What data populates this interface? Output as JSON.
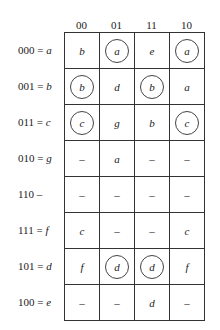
{
  "columns": [
    "00",
    "01",
    "11",
    "10"
  ],
  "rows": [
    {
      "code": "000",
      "eq": " = ",
      "state": "a",
      "cells": [
        {
          "v": "b",
          "circled": false
        },
        {
          "v": "a",
          "circled": true
        },
        {
          "v": "e",
          "circled": false
        },
        {
          "v": "a",
          "circled": true
        }
      ]
    },
    {
      "code": "001",
      "eq": " = ",
      "state": "b",
      "cells": [
        {
          "v": "b",
          "circled": true
        },
        {
          "v": "d",
          "circled": false
        },
        {
          "v": "b",
          "circled": true
        },
        {
          "v": "a",
          "circled": false
        }
      ]
    },
    {
      "code": "011",
      "eq": " = ",
      "state": "c",
      "cells": [
        {
          "v": "c",
          "circled": true
        },
        {
          "v": "g",
          "circled": false
        },
        {
          "v": "b",
          "circled": false
        },
        {
          "v": "c",
          "circled": true
        }
      ]
    },
    {
      "code": "010",
      "eq": " = ",
      "state": "g",
      "cells": [
        {
          "v": "–",
          "circled": false
        },
        {
          "v": "a",
          "circled": false
        },
        {
          "v": "–",
          "circled": false
        },
        {
          "v": "–",
          "circled": false
        }
      ]
    },
    {
      "code": "110",
      "eq": " –",
      "state": "",
      "cells": [
        {
          "v": "–",
          "circled": false
        },
        {
          "v": "–",
          "circled": false
        },
        {
          "v": "–",
          "circled": false
        },
        {
          "v": "–",
          "circled": false
        }
      ]
    },
    {
      "code": "111",
      "eq": " = ",
      "state": "f",
      "cells": [
        {
          "v": "c",
          "circled": false
        },
        {
          "v": "–",
          "circled": false
        },
        {
          "v": "–",
          "circled": false
        },
        {
          "v": "c",
          "circled": false
        }
      ]
    },
    {
      "code": "101",
      "eq": " = ",
      "state": "d",
      "cells": [
        {
          "v": "f",
          "circled": false
        },
        {
          "v": "d",
          "circled": true
        },
        {
          "v": "d",
          "circled": true
        },
        {
          "v": "f",
          "circled": false
        }
      ]
    },
    {
      "code": "100",
      "eq": " = ",
      "state": "e",
      "cells": [
        {
          "v": "–",
          "circled": false
        },
        {
          "v": "–",
          "circled": false
        },
        {
          "v": "d",
          "circled": false
        },
        {
          "v": "–",
          "circled": false
        }
      ]
    }
  ]
}
